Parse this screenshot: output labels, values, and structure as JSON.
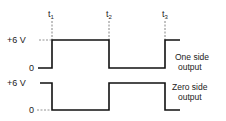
{
  "diagram": {
    "type": "timing-waveform",
    "time_markers": [
      {
        "label": "t",
        "sub": "1",
        "x": 52
      },
      {
        "label": "t",
        "sub": "2",
        "x": 109
      },
      {
        "label": "t",
        "sub": "3",
        "x": 165
      }
    ],
    "waveforms": [
      {
        "name": "One side output",
        "line1": "One side",
        "line2": "output",
        "high_label": "+6 V",
        "low_label": "0",
        "sequence": [
          "low",
          "high",
          "low",
          "high"
        ]
      },
      {
        "name": "Zero side output",
        "line1": "Zero side",
        "line2": "output",
        "high_label": "+6 V",
        "low_label": "0",
        "sequence": [
          "high",
          "low",
          "high",
          "low"
        ]
      }
    ],
    "line_color": "#111111",
    "text_color": "#222222"
  }
}
